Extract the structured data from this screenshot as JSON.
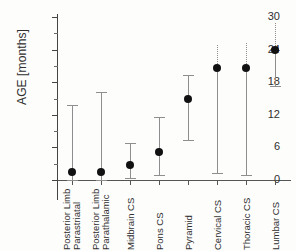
{
  "chart_data": {
    "type": "scatter",
    "title": "",
    "xlabel": "",
    "ylabel": "AGE [months]",
    "ylim": [
      0,
      30
    ],
    "ytick_labels": [
      "0",
      "6",
      "12",
      "18",
      "24",
      "30"
    ],
    "ytick_values": [
      0,
      6,
      12,
      18,
      24,
      30
    ],
    "minor_tick_step": 3,
    "grid": false,
    "legend": "none",
    "categories": [
      "Posterior Limb Parastriatal",
      "Posterior Limb Parathalamic",
      "Midbrain CS",
      "Pons CS",
      "Pyramid",
      "Cervical CS",
      "Thoracic CS",
      "Lumbar CS"
    ],
    "category_lines": [
      [
        "Posterior Limb",
        "Parastriatal"
      ],
      [
        "Posterior Limb",
        "Parathalamic"
      ],
      [
        "Midbrain CS"
      ],
      [
        "Pons CS"
      ],
      [
        "Pyramid"
      ],
      [
        "Cervical CS"
      ],
      [
        "Thoracic CS"
      ],
      [
        "Lumbar CS"
      ]
    ],
    "series": [
      {
        "name": "Mean age with range",
        "values": [
          1.5,
          1.5,
          2.8,
          5.2,
          14.9,
          20.6,
          20.6,
          24.0
        ],
        "upper": [
          13.8,
          16.2,
          6.8,
          11.6,
          19.3,
          24.9,
          25.2,
          28.9
        ],
        "lower": [
          0.0,
          0.0,
          0.4,
          0.9,
          7.4,
          1.3,
          0.9,
          17.3
        ],
        "upper_style": [
          "solid",
          "solid",
          "solid",
          "solid",
          "solid",
          "dotted",
          "dotted",
          "dotted"
        ]
      }
    ],
    "colors": {
      "marker": "#111111",
      "whisker": "#8e8e8e",
      "axis": "#444444",
      "text": "#2f2f2f",
      "background": "#fdfdfc"
    }
  }
}
